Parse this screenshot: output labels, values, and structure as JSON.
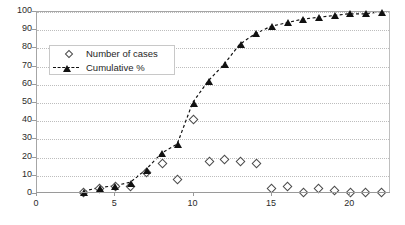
{
  "chart_data": {
    "type": "scatter",
    "title": "",
    "subtitle": "",
    "xlabel": "",
    "ylabel": "",
    "xlim": [
      0,
      22.6
    ],
    "ylim": [
      0,
      100
    ],
    "xticks": [
      0,
      5,
      10,
      15,
      20
    ],
    "yticks": [
      0,
      10,
      20,
      30,
      40,
      50,
      60,
      70,
      80,
      90,
      100
    ],
    "grid": "horizontal-dotted",
    "legend_position": "upper-left-inside",
    "x": [
      3,
      4,
      5,
      6,
      7,
      8,
      9,
      10,
      11,
      12,
      13,
      14,
      15,
      16,
      17,
      18,
      19,
      20,
      21,
      22
    ],
    "series": [
      {
        "name": "Number of cases",
        "marker": "open-diamond",
        "line": "none",
        "values": [
          1,
          3,
          4,
          4,
          12,
          17,
          8,
          41,
          18,
          19,
          18,
          17,
          3,
          4,
          1,
          3,
          2,
          1,
          1,
          1
        ]
      },
      {
        "name": "Cumulative %",
        "marker": "filled-triangle",
        "line": "dashed",
        "values": [
          1,
          3,
          4,
          6,
          13,
          22,
          27,
          50,
          62,
          71,
          82,
          88,
          92,
          94,
          96,
          97,
          98,
          99,
          99,
          100
        ]
      }
    ]
  },
  "legend": {
    "items": [
      {
        "label": "Number of cases",
        "marker": "open-diamond"
      },
      {
        "label": "Cumulative %",
        "marker": "filled-triangle-dashed"
      }
    ]
  },
  "axes": {
    "y_tick_labels": [
      "100",
      "90",
      "80",
      "70",
      "60",
      "50",
      "40",
      "30",
      "20",
      "10",
      "0"
    ],
    "x_tick_labels": [
      "0",
      "5",
      "10",
      "15",
      "20"
    ]
  }
}
